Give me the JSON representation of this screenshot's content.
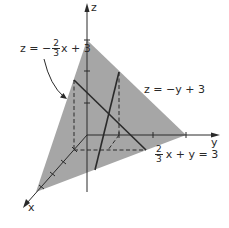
{
  "figure": {
    "type": "3d-planes-intersection",
    "colors": {
      "plane_fill": "#a6a6a6",
      "line": "#2a2a2a",
      "background": "#ffffff"
    },
    "axes": {
      "x_label": "x",
      "y_label": "y",
      "z_label": "z"
    },
    "labels": {
      "plane_x": {
        "lhs": "z = −",
        "frac_num": "2",
        "frac_den": "3",
        "rhs": "x + 3"
      },
      "plane_y": {
        "text": "z = −y + 3"
      },
      "trace_xy": {
        "frac_num": "2",
        "frac_den": "3",
        "rhs": "x + y = 3"
      }
    }
  }
}
